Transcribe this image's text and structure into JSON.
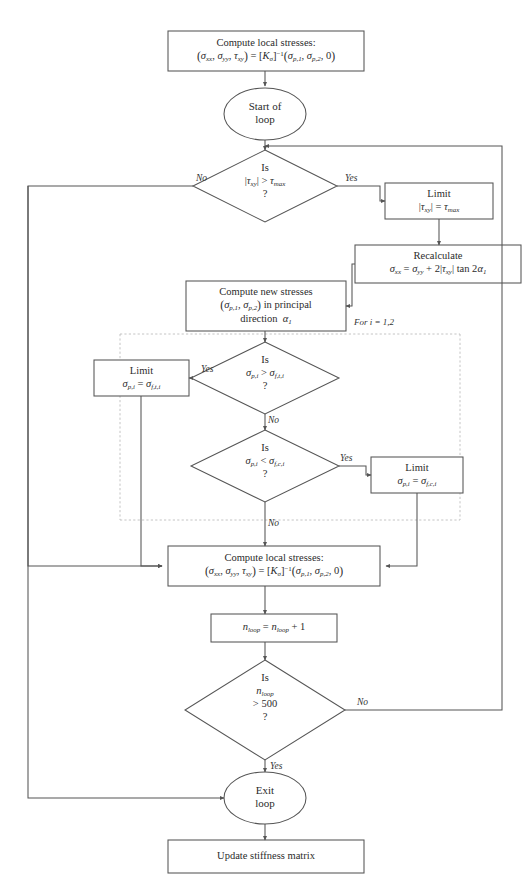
{
  "diagram": {
    "colors": {
      "stroke": "#555555",
      "text": "#2b2b2b",
      "dashed_region": "#bbbbbb",
      "background": "#ffffff"
    }
  },
  "nodes": {
    "compute_local_stresses_top": {
      "shape": "process",
      "line1": "Compute local stresses:",
      "line2_plain": "(σxx, σyy, τxy) = [Kσ]^-1(σp,1, σp,2, 0)"
    },
    "start_loop": {
      "shape": "terminator",
      "line1": "Start of",
      "line2": "loop"
    },
    "decision_tau": {
      "shape": "decision",
      "line1": "Is",
      "line2_plain": "|τxy| > τmax",
      "line3": "?"
    },
    "limit_tau": {
      "shape": "process",
      "line1": "Limit",
      "line2_plain": "|τxy| = τmax"
    },
    "recalculate": {
      "shape": "process",
      "line1": "Recalculate",
      "line2_plain": "σxx = σyy + 2|τxy| tan 2α1"
    },
    "compute_new_stresses": {
      "shape": "process",
      "line1": "Compute new stresses",
      "line2_plain": "(σp,1, σp,2) in principal",
      "line3_plain": "direction α1"
    },
    "decision_tensile": {
      "shape": "decision",
      "line1": "Is",
      "line2_plain": "σp,i > σf,t,i",
      "line3": "?"
    },
    "limit_tensile": {
      "shape": "process",
      "line1": "Limit",
      "line2_plain": "σp,i = σf,t,i"
    },
    "decision_compressive": {
      "shape": "decision",
      "line1": "Is",
      "line2_plain": "σp,i < σf,c,i",
      "line3": "?"
    },
    "limit_compressive": {
      "shape": "process",
      "line1": "Limit",
      "line2_plain": "σp,i = σf,c,i"
    },
    "compute_local_stresses_bottom": {
      "shape": "process",
      "line1": "Compute local stresses:",
      "line2_plain": "(σxx, σyy, τxy) = [Kσ]^-1(σp,1, σp,2, 0)"
    },
    "increment_loop": {
      "shape": "process",
      "line1_plain": "nloop = nloop + 1"
    },
    "decision_nloop": {
      "shape": "decision",
      "line1": "Is",
      "line2_plain": "nloop",
      "line3": "> 500",
      "line4": "?"
    },
    "exit_loop": {
      "shape": "terminator",
      "line1": "Exit",
      "line2": "loop"
    },
    "update_stiffness": {
      "shape": "process",
      "line1": "Update stiffness matrix"
    }
  },
  "edge_labels": {
    "tau_no": "No",
    "tau_yes": "Yes",
    "tensile_yes": "Yes",
    "tensile_no": "No",
    "compressive_yes": "Yes",
    "compressive_no": "No",
    "nloop_no": "No",
    "nloop_yes": "Yes"
  },
  "region_labels": {
    "for_loop": "For i = 1,2"
  }
}
